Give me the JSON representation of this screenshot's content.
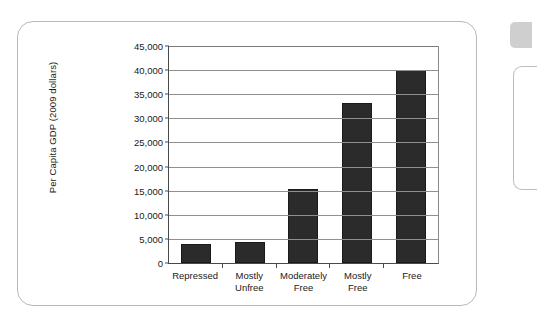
{
  "chart_data": {
    "type": "bar",
    "title": "",
    "subtitle": "",
    "xlabel": "",
    "ylabel": "Per Capita GDP (2009 dollars)",
    "categories": [
      "Repressed",
      "Mostly Unfree",
      "Moderately Free",
      "Mostly Free",
      "Free"
    ],
    "category_lines": [
      [
        "Repressed"
      ],
      [
        "Mostly",
        "Unfree"
      ],
      [
        "Moderately",
        "Free"
      ],
      [
        "Mostly",
        "Free"
      ],
      [
        "Free"
      ]
    ],
    "values": [
      4000,
      4300,
      15400,
      33100,
      40000
    ],
    "ylim": [
      0,
      45000
    ],
    "ytick_step": 5000,
    "ytick_labels": [
      "45,000",
      "40,000",
      "35,000",
      "30,000",
      "25,000",
      "20,000",
      "15,000",
      "10,000",
      "5,000",
      "0"
    ],
    "ytick_values": [
      45000,
      40000,
      35000,
      30000,
      25000,
      20000,
      15000,
      10000,
      5000,
      0
    ],
    "grid": true,
    "legend": null,
    "bar_color": "#2b2b2b",
    "axis_color": "#4a4a4a",
    "gridline_color": "#8f8f8f",
    "background": "#ffffff"
  },
  "frame": {
    "border_color": "#b9b9b9"
  }
}
